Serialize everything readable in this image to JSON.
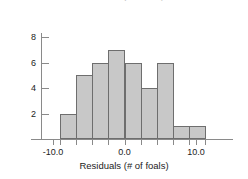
{
  "chart_data": {
    "type": "bar",
    "title": "Residuals (# of foals)",
    "xlabel": "Residuals (# of foals)",
    "ylabel": "",
    "categories": [
      "-9.0",
      "-6.8",
      "-4.5",
      "-2.3",
      "0.0",
      "2.3",
      "4.5",
      "6.8",
      "9.0"
    ],
    "bin_edges": [
      -9.0,
      -6.75,
      -4.5,
      -2.25,
      0.0,
      2.25,
      4.5,
      6.75,
      9.0,
      11.25
    ],
    "values": [
      2,
      5,
      6,
      7,
      6,
      4,
      6,
      1,
      1
    ],
    "total_count": 38,
    "xlim": [
      -12.5,
      13.0
    ],
    "ylim": [
      0,
      8.4
    ],
    "x_ticks": [
      {
        "value": -10.0,
        "label": "-10.0"
      },
      {
        "value": 0.0,
        "label": "0.0"
      },
      {
        "value": 10.0,
        "label": "10.0"
      }
    ],
    "y_ticks": [
      {
        "value": 2,
        "label": "2"
      },
      {
        "value": 4,
        "label": "4"
      },
      {
        "value": 6,
        "label": "6"
      },
      {
        "value": 8,
        "label": "8"
      }
    ],
    "grid": false,
    "legend": null,
    "bar_fill_color": "#c8c8c8",
    "bar_edge_color": "#6e6e6e",
    "axis_color": "#8a8a8a"
  },
  "figure": {
    "cropped_title": "Residuals (# of foals)"
  }
}
